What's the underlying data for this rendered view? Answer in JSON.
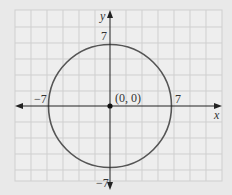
{
  "chart_data": {
    "type": "line",
    "title": "",
    "xlabel": "x",
    "ylabel": "y",
    "xlim": [
      -7,
      8
    ],
    "ylim": [
      -8,
      10
    ],
    "grid": true,
    "series": [
      {
        "name": "circle",
        "equation": "x^2 + y^2 = 49",
        "center": [
          0,
          0
        ],
        "radius": 7
      }
    ],
    "points": [
      {
        "x": 0,
        "y": 0,
        "label": "(0, 0)"
      }
    ],
    "tick_labels": {
      "x": [
        "-7",
        "7"
      ],
      "y": [
        "7",
        "-7"
      ]
    }
  },
  "labels": {
    "x_axis": "x",
    "y_axis": "y",
    "x_neg": "−7",
    "x_pos": "7",
    "y_pos": "7",
    "y_neg": "−7",
    "origin": "(0, 0)"
  },
  "colors": {
    "background": "#e9e9e9",
    "grid_bg": "#eeeeee",
    "grid_line": "#cfcfcf",
    "axis": "#222222",
    "circle": "#555555"
  }
}
